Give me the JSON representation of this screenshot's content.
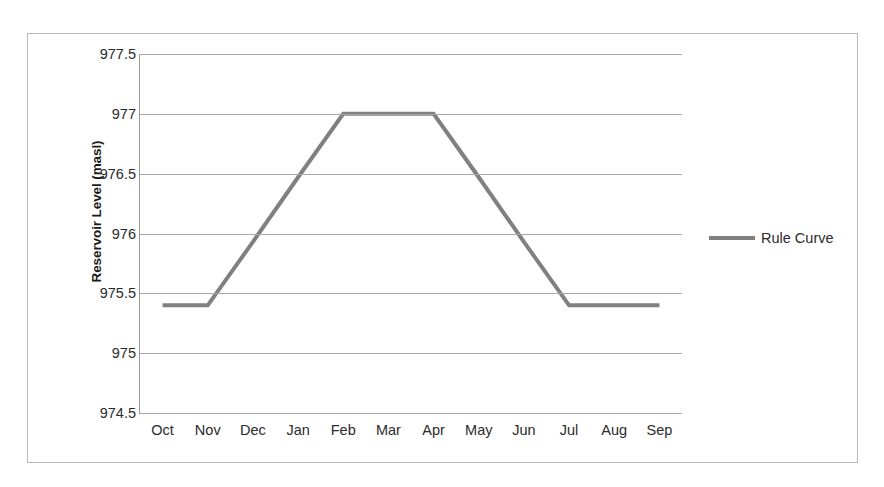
{
  "chart_data": {
    "type": "line",
    "title": "",
    "xlabel": "",
    "ylabel": "Reservoir Level (masl)",
    "categories": [
      "Oct",
      "Nov",
      "Dec",
      "Jan",
      "Feb",
      "Mar",
      "Apr",
      "May",
      "Jun",
      "Jul",
      "Aug",
      "Sep"
    ],
    "series": [
      {
        "name": "Rule Curve",
        "color": "#808080",
        "values": [
          975.4,
          975.4,
          975.93,
          976.47,
          977.0,
          977.0,
          977.0,
          976.47,
          975.93,
          975.4,
          975.4,
          975.4
        ]
      }
    ],
    "ylim": [
      974.5,
      977.5
    ],
    "ytick_labels": [
      "977.5",
      "977",
      "976.5",
      "976",
      "975.5",
      "975",
      "974.5"
    ],
    "ytick_values": [
      977.5,
      977,
      976.5,
      976,
      975.5,
      975,
      974.5
    ],
    "grid": true,
    "legend_position": "right"
  },
  "legend": {
    "entries": [
      {
        "label": "Rule Curve",
        "color": "#808080"
      }
    ]
  },
  "colors": {
    "series_line": "#808080",
    "gridline": "#a8a8a8",
    "axis_line": "#9a9a9a",
    "frame_border": "#b9b9b9",
    "text": "#2b2b2b",
    "title_text": "#1a1a1a",
    "background": "#ffffff"
  }
}
